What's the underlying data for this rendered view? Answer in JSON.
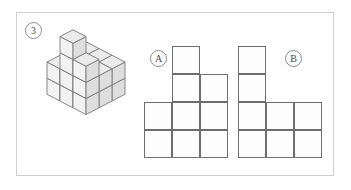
{
  "page": {
    "background_color": "#ffffff",
    "frame_border_color": "#cfcfcf"
  },
  "exercise": {
    "number_label": "3",
    "number_badge_name": "exercise-number-3"
  },
  "figure_3d": {
    "name": "isometric-cube-stack",
    "description": "Isometric drawing of a stack of unit cubes",
    "face_colors": {
      "top": "#ebebeb",
      "left": "#f2f2f2",
      "right": "#dedede",
      "edge": "#7a7a7a"
    },
    "cube_unit_px": 26,
    "cubes": [
      {
        "x": 0,
        "y": 0,
        "z": 0
      },
      {
        "x": 1,
        "y": 0,
        "z": 0
      },
      {
        "x": 2,
        "y": 0,
        "z": 0
      },
      {
        "x": 0,
        "y": 1,
        "z": 0
      },
      {
        "x": 1,
        "y": 1,
        "z": 0
      },
      {
        "x": 2,
        "y": 1,
        "z": 0
      },
      {
        "x": 0,
        "y": 2,
        "z": 0
      },
      {
        "x": 1,
        "y": 2,
        "z": 0
      },
      {
        "x": 2,
        "y": 2,
        "z": 0
      },
      {
        "x": 0,
        "y": 0,
        "z": 1
      },
      {
        "x": 1,
        "y": 0,
        "z": 1
      },
      {
        "x": 2,
        "y": 0,
        "z": 1
      },
      {
        "x": 0,
        "y": 1,
        "z": 1
      },
      {
        "x": 1,
        "y": 1,
        "z": 1
      },
      {
        "x": 2,
        "y": 1,
        "z": 1
      },
      {
        "x": 0,
        "y": 2,
        "z": 1
      },
      {
        "x": 1,
        "y": 2,
        "z": 1
      },
      {
        "x": 2,
        "y": 2,
        "z": 1
      },
      {
        "x": 1,
        "y": 2,
        "z": 2
      },
      {
        "x": 2,
        "y": 2,
        "z": 2
      },
      {
        "x": 1,
        "y": 2,
        "z": 3
      }
    ]
  },
  "options": [
    {
      "label": "A",
      "name": "option-a",
      "grid": {
        "columns": 3,
        "rows": 4,
        "cell_px": 28,
        "filled": [
          {
            "row": 0,
            "col": 1
          },
          {
            "row": 1,
            "col": 1
          },
          {
            "row": 1,
            "col": 2
          },
          {
            "row": 2,
            "col": 0
          },
          {
            "row": 2,
            "col": 1
          },
          {
            "row": 2,
            "col": 2
          },
          {
            "row": 3,
            "col": 0
          },
          {
            "row": 3,
            "col": 1
          },
          {
            "row": 3,
            "col": 2
          }
        ]
      }
    },
    {
      "label": "B",
      "name": "option-b",
      "grid": {
        "columns": 3,
        "rows": 4,
        "cell_px": 28,
        "filled": [
          {
            "row": 0,
            "col": 0
          },
          {
            "row": 1,
            "col": 0
          },
          {
            "row": 2,
            "col": 0
          },
          {
            "row": 2,
            "col": 1
          },
          {
            "row": 2,
            "col": 2
          },
          {
            "row": 3,
            "col": 0
          },
          {
            "row": 3,
            "col": 1
          },
          {
            "row": 3,
            "col": 2
          }
        ]
      }
    }
  ],
  "colors": {
    "cell_border": "#6e6e6e",
    "cell_fill": "#fdfdfd",
    "badge_border": "#8a8a8a",
    "badge_text": "#4a4a4a"
  }
}
